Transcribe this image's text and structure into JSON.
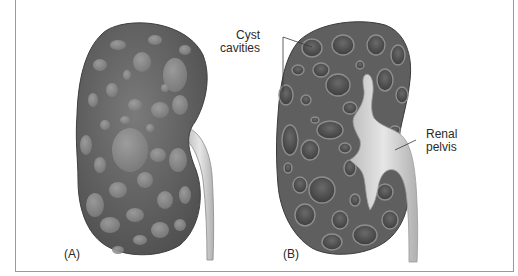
{
  "figure": {
    "panels": [
      {
        "id": "A",
        "label": "(A)",
        "description": "Polycystic kidney, external view"
      },
      {
        "id": "B",
        "label": "(B)",
        "description": "Polycystic kidney, cut section"
      }
    ],
    "annotations": {
      "cyst_cavities": {
        "line1": "Cyst",
        "line2": "cavities"
      },
      "renal_pelvis": {
        "line1": "Renal",
        "line2": "pelvis"
      }
    },
    "colors": {
      "kidney_dark": "#5e5e5e",
      "kidney_mid": "#767676",
      "cyst_light": "#8f8f8f",
      "cavity_dark": "#3f3f3f",
      "pelvis": "#e4e4e4",
      "ureter": "#d2d2d2",
      "border": "#9a9a9a"
    }
  }
}
